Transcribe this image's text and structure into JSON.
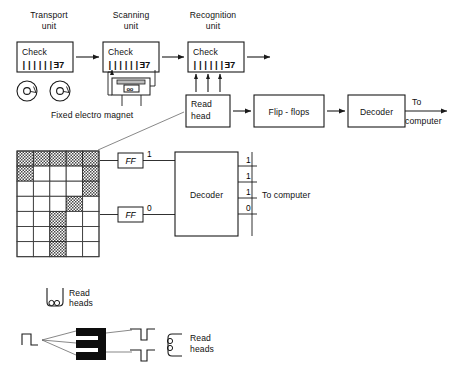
{
  "figure": {
    "background": "#ffffff",
    "ink": "#111111"
  },
  "top_row": {
    "units": [
      {
        "name": "transport-unit",
        "label_line1": "Transport",
        "label_line2": "unit",
        "check_label": "Check",
        "check_micr": "||||||Ǝ7"
      },
      {
        "name": "scanning-unit",
        "label_line1": "Scanning",
        "label_line2": "unit",
        "check_label": "Check",
        "check_micr": "||||||Ǝ7"
      },
      {
        "name": "recognition-unit",
        "label_line1": "Recognition",
        "label_line2": "unit",
        "check_label": "Check",
        "check_micr": "||||||Ǝ7"
      }
    ],
    "magnet_caption": "Fixed electro magnet",
    "read_head": {
      "line1": "Read",
      "line2": "head"
    },
    "flip_flops": "Flip - flops",
    "decoder": "Decoder",
    "output": {
      "line1": "To",
      "line2": "computer"
    }
  },
  "matrix": {
    "name": "character-dot-matrix",
    "columns": 5,
    "rows": 7,
    "cells": [
      [
        1,
        1,
        1,
        1,
        1
      ],
      [
        1,
        0,
        0,
        0,
        1
      ],
      [
        0,
        0,
        0,
        0,
        1
      ],
      [
        0,
        0,
        0,
        1,
        0
      ],
      [
        0,
        0,
        1,
        0,
        0
      ],
      [
        0,
        0,
        1,
        0,
        0
      ],
      [
        0,
        0,
        1,
        0,
        0
      ]
    ]
  },
  "lower_row": {
    "ff_blocks": [
      {
        "label": "FF",
        "bit": "1"
      },
      {
        "label": "FF",
        "bit": "0"
      }
    ],
    "decoder": "Decoder",
    "decoder_outputs": [
      "1",
      "1",
      "1",
      "0"
    ],
    "to_computer": "To computer"
  },
  "bottom": {
    "read_heads_upper": {
      "line1": "Read",
      "line2": "heads"
    },
    "read_heads_lower": {
      "line1": "Read",
      "line2": "heads"
    },
    "character_glyph": "Ǝ"
  }
}
